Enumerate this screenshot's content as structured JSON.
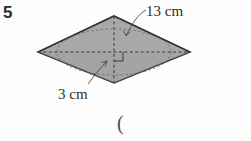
{
  "page": {
    "background_color": "#fdfdfd",
    "width": 251,
    "height": 141
  },
  "question": {
    "number": "5"
  },
  "figure": {
    "shape_name": "rhombus",
    "fill_color": "#a8a8a8",
    "stroke_color": "#2f2f2f",
    "diagonal_style": "dashed",
    "right_angle_marker": true,
    "inscribed_ellipse": true,
    "vertices": {
      "left": [
        38,
        52
      ],
      "top": [
        114,
        16
      ],
      "right": [
        190,
        52
      ],
      "bottom": [
        114,
        83
      ]
    }
  },
  "labels": {
    "side_length": "13 cm",
    "height": "3 cm",
    "trailing_paren": "("
  }
}
